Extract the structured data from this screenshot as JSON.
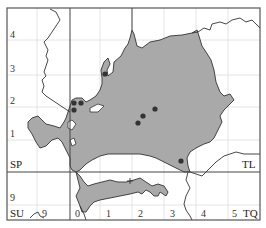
{
  "map": {
    "title": "",
    "colors": {
      "frame": "#555555",
      "major_grid": "#444444",
      "minor_grid": "#dddddd",
      "region_fill": "#a9a9a9",
      "region_stroke": "#333333",
      "river": "#333333",
      "dot": "#333333",
      "background": "#ffffff"
    },
    "grid_squares": {
      "top_left": "SP",
      "top_right": "TL",
      "bottom_left": "SU",
      "bottom_right": "TQ"
    },
    "y_tick_labels": [
      {
        "label": "4",
        "y": 35
      },
      {
        "label": "3",
        "y": 69
      },
      {
        "label": "2",
        "y": 101
      },
      {
        "label": "1",
        "y": 134
      },
      {
        "label": "9",
        "y": 198
      }
    ],
    "x_tick_labels": [
      {
        "label": "9",
        "x": 44
      },
      {
        "label": "0",
        "x": 77
      },
      {
        "label": "1",
        "x": 108
      },
      {
        "label": "2",
        "x": 140
      },
      {
        "label": "3",
        "x": 172
      },
      {
        "label": "4",
        "x": 203
      },
      {
        "label": "5",
        "x": 234
      }
    ],
    "record_dots": [
      {
        "x": 105,
        "y": 74
      },
      {
        "x": 74,
        "y": 103
      },
      {
        "x": 81,
        "y": 103
      },
      {
        "x": 74,
        "y": 110
      },
      {
        "x": 155,
        "y": 109
      },
      {
        "x": 143,
        "y": 116
      },
      {
        "x": 138,
        "y": 123
      },
      {
        "x": 181,
        "y": 161
      }
    ],
    "cross_markers": [
      {
        "x": 130,
        "y": 181
      }
    ]
  }
}
